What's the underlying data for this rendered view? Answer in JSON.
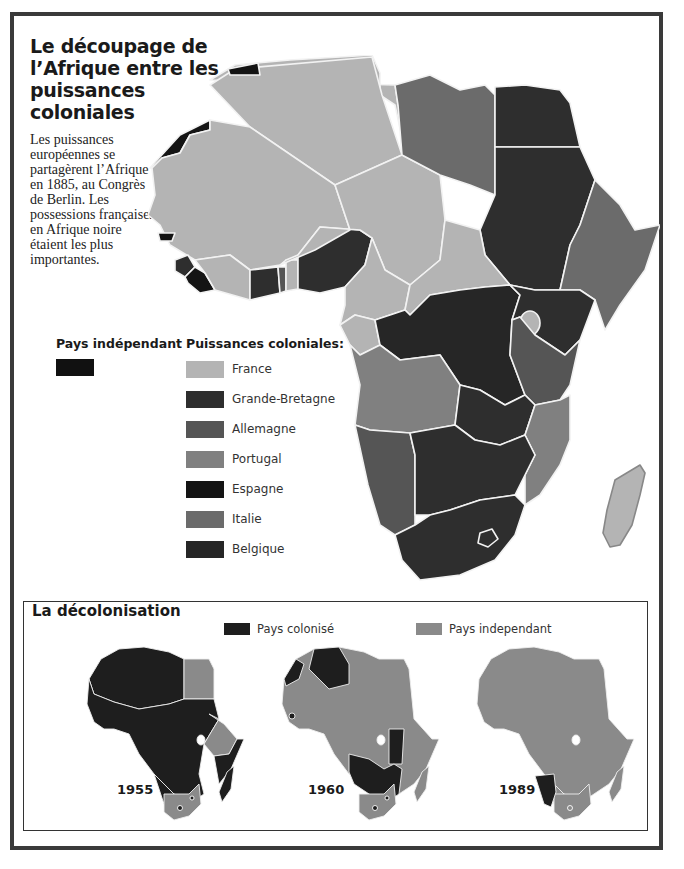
{
  "title": "Le découpage de l’Afrique entre les puissances coloniales",
  "intro": "Les puissances européennes se partagèrent l’Afrique en 1885, au Congrès de Berlin. Les possessions françaises en Afrique noire étaient les plus importantes.",
  "colors": {
    "france": "#b4b4b4",
    "grande_bretagne": "#2e2e2e",
    "allemagne": "#555555",
    "portugal": "#808080",
    "espagne": "#141414",
    "italie": "#6b6b6b",
    "belgique": "#262626",
    "independant_1885": "#111111",
    "colonise": "#1e1e1e",
    "independant": "#8a8a8a",
    "border": "#f2f2f2",
    "frame": "#3a3a3a"
  },
  "legend": {
    "independent_heading": "Pays indépendant",
    "colonial_heading": "Puissances coloniales:",
    "powers": [
      {
        "label": "France",
        "key": "france"
      },
      {
        "label": "Grande-Bretagne",
        "key": "grande_bretagne"
      },
      {
        "label": "Allemagne",
        "key": "allemagne"
      },
      {
        "label": "Portugal",
        "key": "portugal"
      },
      {
        "label": "Espagne",
        "key": "espagne"
      },
      {
        "label": "Italie",
        "key": "italie"
      },
      {
        "label": "Belgique",
        "key": "belgique"
      }
    ]
  },
  "decolonisation": {
    "title": "La décolonisation",
    "legend": {
      "colonised": "Pays colonisé",
      "independent": "Pays independant"
    },
    "maps": [
      {
        "year": "1955"
      },
      {
        "year": "1960"
      },
      {
        "year": "1989"
      }
    ]
  }
}
